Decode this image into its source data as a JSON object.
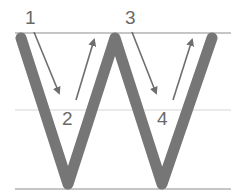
{
  "diagram": {
    "letter": "W",
    "colors": {
      "guide_line": "#c8c8c8",
      "letter_stroke": "#767676",
      "arrow": "#6e6e6e",
      "label": "#6a6a6a",
      "background": "#ffffff"
    },
    "guide_lines": [
      {
        "name": "top-line",
        "y": 33
      },
      {
        "name": "mid-line",
        "y": 110
      },
      {
        "name": "baseline",
        "y": 189
      }
    ],
    "strokes": [
      {
        "number": "1",
        "direction": "down-right"
      },
      {
        "number": "2",
        "direction": "up-right"
      },
      {
        "number": "3",
        "direction": "down-right"
      },
      {
        "number": "4",
        "direction": "up-right"
      }
    ],
    "labels": [
      "1",
      "2",
      "3",
      "4"
    ]
  }
}
